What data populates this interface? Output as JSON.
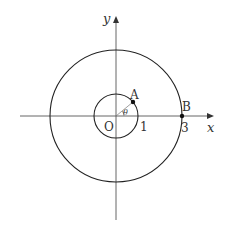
{
  "diagram": {
    "type": "coordinate-plane-circles",
    "axes": {
      "x_label": "x",
      "y_label": "y",
      "origin_label": "O"
    },
    "circles": [
      {
        "name": "inner",
        "radius": 1,
        "tick_label": "1"
      },
      {
        "name": "outer",
        "radius": 3,
        "tick_label": "3"
      }
    ],
    "points": [
      {
        "name": "A",
        "label": "A",
        "on": "inner circle"
      },
      {
        "name": "B",
        "label": "B",
        "on": "outer circle, x-axis"
      }
    ],
    "angle": {
      "label": "θ",
      "between": "positive x-axis and OA"
    },
    "colors": {
      "stroke": "#222222",
      "axis": "#555555"
    }
  }
}
